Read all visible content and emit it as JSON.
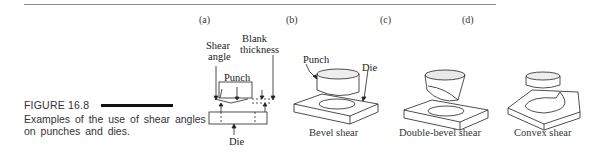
{
  "figure": {
    "label": "FIGURE 16.8",
    "caption": "Examples of the use of shear angles on punches and dies."
  },
  "panels": [
    {
      "letter": "(a)",
      "caption": "",
      "labels": {
        "shear_angle_1": "Shear",
        "shear_angle_2": "angle",
        "blank_1": "Blank",
        "blank_2": "thickness",
        "punch": "Punch",
        "die": "Die"
      }
    },
    {
      "letter": "(b)",
      "caption": "Bevel shear",
      "labels": {
        "punch": "Punch",
        "die": "Die"
      }
    },
    {
      "letter": "(c)",
      "caption": "Double-bevel shear"
    },
    {
      "letter": "(d)",
      "caption": "Convex shear"
    }
  ],
  "colors": {
    "ink": "#222222",
    "rule": "#8a8a8a",
    "bar": "#111111"
  }
}
